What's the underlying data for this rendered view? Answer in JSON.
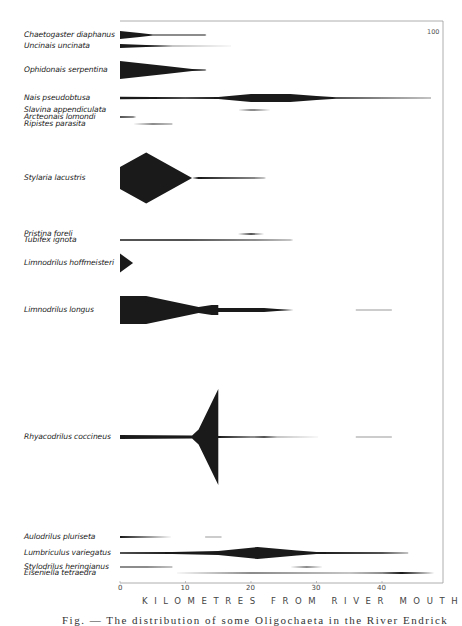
{
  "chart_data": {
    "type": "kite diagram",
    "title": "",
    "xlabel": "KILOMETRES FROM RIVER MOUTH",
    "ylabel": "",
    "x_ticks": [
      0,
      10,
      20,
      30,
      40
    ],
    "xlim": [
      0,
      49.5
    ],
    "scale_annotation": "100",
    "grid": false,
    "series": [
      {
        "name": "Chaetogaster diaphanus",
        "y": 35,
        "profile": [
          [
            0,
            8
          ],
          [
            3,
            4
          ],
          [
            5,
            1
          ],
          [
            13,
            0.8
          ],
          [
            13.2,
            0
          ]
        ]
      },
      {
        "name": "Uncinais uncinata",
        "y": 46,
        "profile": [
          [
            0,
            4
          ],
          [
            4,
            2
          ],
          [
            8,
            0.6
          ],
          [
            18,
            0.3
          ]
        ]
      },
      {
        "name": "Ophidonais serpentina",
        "y": 70,
        "profile": [
          [
            0,
            18
          ],
          [
            7,
            8
          ],
          [
            11,
            2
          ],
          [
            13,
            0.8
          ],
          [
            13.2,
            0
          ]
        ]
      },
      {
        "name": "Nais pseudobtusa",
        "y": 98,
        "profile": [
          [
            0,
            2.5
          ],
          [
            10,
            1.5
          ],
          [
            15,
            2
          ],
          [
            20,
            8
          ],
          [
            26,
            8
          ],
          [
            30,
            4
          ],
          [
            33,
            1.5
          ],
          [
            40,
            1.2
          ],
          [
            47.5,
            0.3
          ]
        ]
      },
      {
        "name": "Slavina appendiculata",
        "y": 110,
        "profile": [
          [
            18,
            0
          ],
          [
            20,
            1.2
          ],
          [
            23,
            0
          ]
        ]
      },
      {
        "name": "Arcteonais lomondi",
        "y": 117,
        "profile": [
          [
            0,
            1.5
          ],
          [
            2,
            1
          ],
          [
            2.5,
            0
          ]
        ]
      },
      {
        "name": "Ripistes parasita",
        "y": 124,
        "profile": [
          [
            2,
            0
          ],
          [
            5,
            1.2
          ],
          [
            8,
            0.5
          ]
        ]
      },
      {
        "name": "Stylaria lacustris",
        "y": 178,
        "profile": [
          [
            0,
            22
          ],
          [
            4,
            51
          ],
          [
            11,
            0
          ],
          [
            12,
            2
          ],
          [
            16,
            1.5
          ],
          [
            22,
            0.6
          ],
          [
            22.3,
            0
          ]
        ]
      },
      {
        "name": "Pristina foreli",
        "y": 234,
        "profile": [
          [
            18,
            0
          ],
          [
            20,
            1.5
          ],
          [
            22,
            0
          ]
        ]
      },
      {
        "name": "Tubifex ignota",
        "y": 240,
        "profile": [
          [
            0,
            1.5
          ],
          [
            10,
            1.5
          ],
          [
            20,
            1.2
          ],
          [
            26,
            0.5
          ],
          [
            26.5,
            0
          ]
        ]
      },
      {
        "name": "Limnodrilus hoffmeisteri",
        "y": 263,
        "profile": [
          [
            0,
            19
          ],
          [
            2,
            0
          ]
        ]
      },
      {
        "name": "Limnodrilus longus",
        "y": 310,
        "profile": [
          [
            0,
            28
          ],
          [
            4,
            28
          ],
          [
            12,
            6
          ],
          [
            14,
            10
          ],
          [
            15,
            10
          ],
          [
            15,
            4
          ],
          [
            22,
            4
          ],
          [
            24,
            2
          ],
          [
            26.5,
            0
          ]
        ],
        "extra_segments": [
          [
            36,
            0.3
          ],
          [
            41.5,
            0.3
          ]
        ]
      },
      {
        "name": "Rhyacodrilus coccineus",
        "y": 437,
        "profile": [
          [
            0,
            4
          ],
          [
            11,
            3
          ],
          [
            12,
            15
          ],
          [
            15,
            96
          ],
          [
            15,
            2
          ],
          [
            20,
            0.7
          ],
          [
            22,
            1.5
          ],
          [
            24,
            0.6
          ],
          [
            31,
            0.2
          ]
        ],
        "extra_segments": [
          [
            36,
            0.3
          ],
          [
            41.5,
            0.3
          ]
        ]
      },
      {
        "name": "Aulodrilus pluriseta",
        "y": 537,
        "profile": [
          [
            0,
            2
          ],
          [
            4,
            1
          ],
          [
            8,
            0.3
          ]
        ],
        "extra_segments": [
          [
            13,
            0.3
          ],
          [
            15.5,
            0.3
          ]
        ]
      },
      {
        "name": "Lumbriculus variegatus",
        "y": 553,
        "profile": [
          [
            0,
            1.5
          ],
          [
            8,
            1.8
          ],
          [
            15,
            4
          ],
          [
            21,
            12
          ],
          [
            27,
            5
          ],
          [
            30,
            2
          ],
          [
            40,
            1.5
          ],
          [
            44,
            0.5
          ]
        ]
      },
      {
        "name": "Stylodrilus heringianus",
        "y": 567,
        "profile": [
          [
            0,
            1
          ],
          [
            4,
            1.2
          ],
          [
            8,
            0.5
          ]
        ],
        "extra_segments_kite": [
          [
            26,
            0
          ],
          [
            28.5,
            1.2
          ],
          [
            31,
            0
          ]
        ]
      },
      {
        "name": "Eiseniella tetraedra",
        "y": 573,
        "profile": [
          [
            8,
            0.3
          ],
          [
            20,
            0.8
          ],
          [
            35,
            0.5
          ],
          [
            40,
            1.2
          ],
          [
            43,
            2.2
          ],
          [
            47,
            0.5
          ],
          [
            48,
            0
          ]
        ]
      }
    ]
  },
  "labels": {
    "Chaetogaster diaphanus": "Chaetogaster diaphanus",
    "Uncinais uncinata": "Uncinais uncinata",
    "Ophidonais serpentina": "Ophidonais serpentina",
    "Nais pseudobtusa": "Nais pseudobtusa",
    "Slavina appendiculata": "Slavina appendiculata",
    "Arcteonais lomondi": "Arcteonais lomondi",
    "Ripistes parasita": "Ripistes parasita",
    "Stylaria lacustris": "Stylaria lacustris",
    "Pristina foreli": "Pristina foreli",
    "Tubifex ignota": "Tubifex ignota",
    "Limnodrilus hoffmeisteri": "Limnodrilus hoffmeisteri",
    "Limnodrilus longus": "Limnodrilus longus",
    "Rhyacodrilus coccineus": "Rhyacodrilus coccineus",
    "Aulodrilus pluriseta": "Aulodrilus pluriseta",
    "Lumbriculus variegatus": "Lumbriculus variegatus",
    "Stylodrilus heringianus": "Stylodrilus heringianus",
    "Eiseniella tetraedra": "Eiseniella tetraedra"
  },
  "caption": "Fig. — The distribution of some Oligochaeta in the River Endrick",
  "colors": {
    "ink": "#1a1a1a",
    "frame": "#999999"
  }
}
